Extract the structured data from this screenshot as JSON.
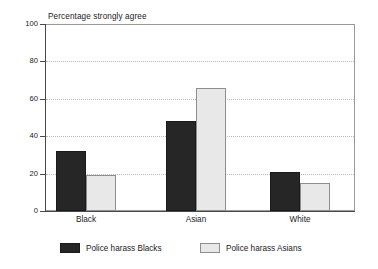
{
  "chart_data": {
    "type": "bar",
    "title": "Percentage strongly agree",
    "xlabel": "",
    "ylabel": "",
    "ylim": [
      0,
      100
    ],
    "yticks": [
      0,
      20,
      40,
      60,
      80,
      100
    ],
    "ytick_labels": [
      "0",
      "20",
      "40",
      "60",
      "80",
      "100"
    ],
    "grid": true,
    "grid_axis": "y",
    "legend_position": "bottom",
    "categories": [
      "Black",
      "Asian",
      "White"
    ],
    "series": [
      {
        "name": "Police harass Blacks",
        "color": "#262626",
        "values": [
          32,
          48,
          21
        ]
      },
      {
        "name": "Police harass Asians",
        "color": "#e8e8e8",
        "values": [
          19,
          66,
          15
        ]
      }
    ]
  },
  "axes": {
    "y_axis_name": "y-axis",
    "x_axis_name": "x-axis"
  },
  "colors": {
    "series_dark": "#262626",
    "series_light": "#e8e8e8",
    "grid": "#b9b9b9",
    "axis": "#4a4a4a",
    "frame": "#9a9a9a",
    "text": "#1a1a1a",
    "background": "#ffffff"
  }
}
